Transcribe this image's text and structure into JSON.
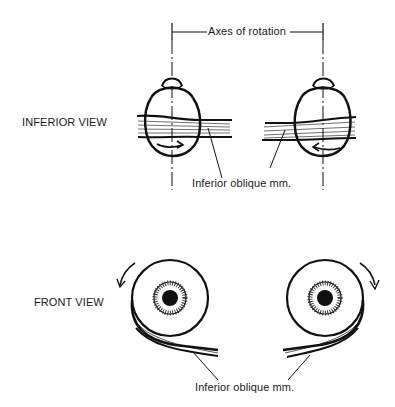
{
  "axes_label": "Axes of rotation",
  "views": [
    {
      "title": "INFERIOR VIEW",
      "muscle_label": "Inferior oblique mm."
    },
    {
      "title": "FRONT VIEW",
      "muscle_label": "Inferior oblique mm."
    }
  ],
  "colors": {
    "ink": "#111111",
    "background": "#ffffff"
  }
}
